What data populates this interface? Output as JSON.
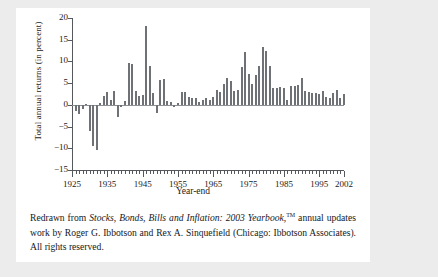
{
  "figure": {
    "ylabel": "Total annual returns (in percent)",
    "xlabel": "Year-end"
  },
  "caption": {
    "lead": "Redrawn from ",
    "title": "Stocks, Bonds, Bills and Inflation: 2003 Yearbook,",
    "tm": "TM",
    "rest": " annual updates work by Roger G. Ibbotson and Rex A. Sinquefield (Chicago: Ibbotson Associates). All rights reserved."
  },
  "colors": {
    "bar": "#6e7176",
    "axis": "#55585c",
    "page_background": "#ececec",
    "card_background": "#ffffff",
    "text": "#15181c"
  },
  "chart_data": {
    "type": "bar",
    "title": "",
    "xlabel": "Year-end",
    "ylabel": "Total annual returns (in percent)",
    "xlim": [
      1925,
      2002
    ],
    "ylim": [
      -15,
      20
    ],
    "ytick_labels": [
      "20",
      "15",
      "10",
      "5",
      "0",
      "-5",
      "-10",
      "-15"
    ],
    "yticks": [
      20,
      15,
      10,
      5,
      0,
      -5,
      -10,
      -15
    ],
    "xtick_labels": [
      "1925",
      "1935",
      "1945",
      "1955",
      "1965",
      "1975",
      "1985",
      "1995",
      "2002"
    ],
    "xticks": [
      1925,
      1935,
      1945,
      1955,
      1965,
      1975,
      1985,
      1995,
      2002
    ],
    "grid": false,
    "legend": null,
    "categories": [
      1926,
      1927,
      1928,
      1929,
      1930,
      1931,
      1932,
      1933,
      1934,
      1935,
      1936,
      1937,
      1938,
      1939,
      1940,
      1941,
      1942,
      1943,
      1944,
      1945,
      1946,
      1947,
      1948,
      1949,
      1950,
      1951,
      1952,
      1953,
      1954,
      1955,
      1956,
      1957,
      1958,
      1959,
      1960,
      1961,
      1962,
      1963,
      1964,
      1965,
      1966,
      1967,
      1968,
      1969,
      1970,
      1971,
      1972,
      1973,
      1974,
      1975,
      1976,
      1977,
      1978,
      1979,
      1980,
      1981,
      1982,
      1983,
      1984,
      1985,
      1986,
      1987,
      1988,
      1989,
      1990,
      1991,
      1992,
      1993,
      1994,
      1995,
      1996,
      1997,
      1998,
      1999,
      2000,
      2001,
      2002
    ],
    "values": [
      -1.5,
      -2.1,
      -1.0,
      0.2,
      -6.0,
      -9.5,
      -10.3,
      0.5,
      2.0,
      3.0,
      1.2,
      3.1,
      -2.8,
      -0.5,
      1.0,
      9.7,
      9.3,
      3.2,
      2.1,
      2.3,
      18.2,
      9.0,
      2.7,
      -1.8,
      5.8,
      5.9,
      0.9,
      0.6,
      -0.5,
      0.4,
      2.9,
      3.0,
      1.8,
      1.5,
      1.5,
      0.7,
      1.2,
      1.6,
      1.2,
      1.9,
      3.4,
      3.0,
      4.7,
      6.2,
      5.6,
      3.3,
      3.4,
      8.8,
      12.2,
      7.0,
      4.8,
      6.8,
      9.0,
      13.3,
      12.4,
      8.9,
      3.9,
      3.8,
      4.0,
      3.8,
      1.1,
      4.4,
      4.4,
      4.6,
      6.1,
      3.1,
      2.9,
      2.7,
      2.7,
      2.5,
      3.3,
      1.7,
      1.6,
      2.7,
      3.4,
      1.6,
      2.4
    ]
  }
}
